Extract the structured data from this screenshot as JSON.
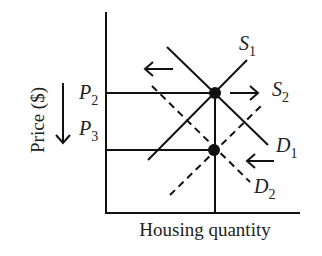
{
  "diagram": {
    "axes": {
      "x_label": "Housing quantity",
      "y_label": "Price ($)"
    },
    "price_levels": [
      {
        "name": "P",
        "sub": "2"
      },
      {
        "name": "P",
        "sub": "3"
      }
    ],
    "curves": [
      {
        "id": "S1",
        "name": "S",
        "sub": "1",
        "type": "supply",
        "style": "solid"
      },
      {
        "id": "S2",
        "name": "S",
        "sub": "2",
        "type": "supply",
        "style": "dashed"
      },
      {
        "id": "D1",
        "name": "D",
        "sub": "1",
        "type": "demand",
        "style": "solid"
      },
      {
        "id": "D2",
        "name": "D",
        "sub": "2",
        "type": "demand",
        "style": "dashed"
      }
    ],
    "shift_arrows": [
      {
        "id": "demand-shift-top",
        "direction": "left"
      },
      {
        "id": "supply-shift",
        "direction": "right"
      },
      {
        "id": "demand-shift-bottom",
        "direction": "left"
      },
      {
        "id": "price-fall",
        "direction": "down"
      }
    ],
    "equilibria": [
      {
        "id": "E1",
        "at": "S1 x D1",
        "price": "P2"
      },
      {
        "id": "E2",
        "at": "S2 x D2",
        "price": "P3"
      }
    ],
    "colors": {
      "line": "#111111",
      "background": "#ffffff"
    }
  }
}
